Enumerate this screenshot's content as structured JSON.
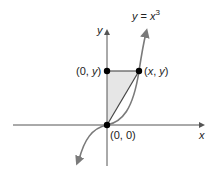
{
  "diagram": {
    "curve_label": {
      "y": "y",
      "eq": " = ",
      "x": "x",
      "exp": "3"
    },
    "axes": {
      "x_label": "x",
      "y_label": "y"
    },
    "points": {
      "origin": "(0, 0)",
      "top_left": {
        "open": "(0, ",
        "var": "y",
        "close": ")"
      },
      "top_right": {
        "open": "(",
        "x": "x",
        "sep": ", ",
        "y": "y",
        "close": ")"
      }
    },
    "colors": {
      "axis": "#555555",
      "curve": "#7a7a7a",
      "shade": "#e6e6e6",
      "point": "#000000",
      "segment": "#555555"
    }
  }
}
